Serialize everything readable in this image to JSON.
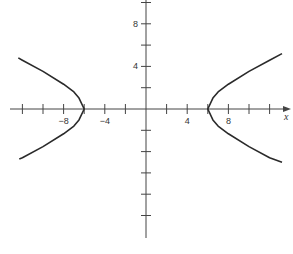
{
  "chart_data": {
    "type": "line",
    "title": "",
    "xlabel": "x",
    "ylabel": "",
    "equation_implied": "x^2/36 - y^2/7 = 1",
    "xlim": [
      -13.2,
      14.0
    ],
    "ylim": [
      -12.2,
      10.3
    ],
    "grid": false,
    "legend": null,
    "x_ticks": [
      -12,
      -10,
      -8,
      -6,
      -4,
      -2,
      2,
      4,
      6,
      8,
      10,
      12
    ],
    "x_tick_labels": [
      {
        "value": -8,
        "label": "-8"
      },
      {
        "value": -4,
        "label": "-4"
      },
      {
        "value": 4,
        "label": "4"
      },
      {
        "value": 8,
        "label": "8"
      }
    ],
    "y_ticks": [
      10,
      8,
      6,
      4,
      2,
      -2,
      -4,
      -6,
      -8,
      -10
    ],
    "y_tick_labels": [
      {
        "value": 8,
        "label": "8"
      },
      {
        "value": 4,
        "label": "4"
      }
    ],
    "series": [
      {
        "name": "right branch",
        "points": [
          [
            13.2,
            5.2
          ],
          [
            12,
            4.58
          ],
          [
            10,
            3.53
          ],
          [
            8,
            2.33
          ],
          [
            7,
            1.61
          ],
          [
            6.5,
            1.02
          ],
          [
            6,
            0
          ],
          [
            6.5,
            -1.02
          ],
          [
            7,
            -1.61
          ],
          [
            8,
            -2.33
          ],
          [
            10,
            -3.53
          ],
          [
            12,
            -4.58
          ],
          [
            13.2,
            -5.0
          ]
        ]
      },
      {
        "name": "left branch",
        "points": [
          [
            -12.4,
            4.8
          ],
          [
            -12,
            4.58
          ],
          [
            -10,
            3.53
          ],
          [
            -8,
            2.33
          ],
          [
            -7,
            1.61
          ],
          [
            -6.5,
            1.02
          ],
          [
            -6,
            0
          ],
          [
            -6.5,
            -1.02
          ],
          [
            -7,
            -1.61
          ],
          [
            -8,
            -2.33
          ],
          [
            -10,
            -3.53
          ],
          [
            -12,
            -4.58
          ],
          [
            -12.3,
            -4.7
          ]
        ]
      }
    ],
    "vertices": [
      [
        -6,
        0
      ],
      [
        6,
        0
      ]
    ],
    "colors": {
      "curve": "#2a2a2a",
      "axis": "#444444"
    }
  }
}
